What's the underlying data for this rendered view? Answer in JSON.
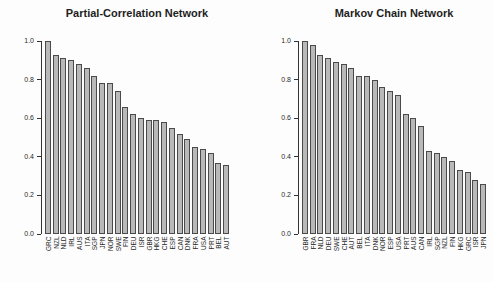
{
  "figure": {
    "background": "#fdfdfd",
    "axis_color": "#333333",
    "bar_fill": "#b9b9b9",
    "bar_border": "#4a4a4a",
    "title_color": "#1f1f1f"
  },
  "chart_data": [
    {
      "type": "bar",
      "title": "Partial-Correlation Network",
      "xlabel": "",
      "ylabel": "",
      "ylim": [
        0.0,
        1.0
      ],
      "yticks": [
        0.0,
        0.2,
        0.4,
        0.6,
        0.8,
        1.0
      ],
      "ytick_labels": [
        "0.0",
        "0.2",
        "0.4",
        "0.6",
        "0.8",
        "1.0"
      ],
      "grid": false,
      "legend": null,
      "categories": [
        "GRC",
        "NZL",
        "NLD",
        "IRL",
        "AUS",
        "ITA",
        "SGP",
        "JPN",
        "NOR",
        "SWE",
        "FIN",
        "DEU",
        "ISR",
        "GBR",
        "HKG",
        "CHE",
        "ESP",
        "CAN",
        "DNK",
        "FRA",
        "USA",
        "PRT",
        "BEL",
        "AUT"
      ],
      "values": [
        1.0,
        0.93,
        0.91,
        0.9,
        0.88,
        0.86,
        0.82,
        0.78,
        0.78,
        0.74,
        0.66,
        0.62,
        0.6,
        0.59,
        0.59,
        0.58,
        0.55,
        0.52,
        0.49,
        0.45,
        0.44,
        0.42,
        0.37,
        0.36
      ]
    },
    {
      "type": "bar",
      "title": "Markov Chain Network",
      "xlabel": "",
      "ylabel": "",
      "ylim": [
        0.0,
        1.0
      ],
      "yticks": [
        0.0,
        0.2,
        0.4,
        0.6,
        0.8,
        1.0
      ],
      "ytick_labels": [
        "0.0",
        "0.2",
        "0.4",
        "0.6",
        "0.8",
        "1.0"
      ],
      "grid": false,
      "legend": null,
      "categories": [
        "GBR",
        "FRA",
        "NLD",
        "DEU",
        "SWE",
        "CHE",
        "AUT",
        "BEL",
        "ITA",
        "DNK",
        "NOR",
        "ESP",
        "USA",
        "PRT",
        "AUS",
        "CAN",
        "IRL",
        "SGP",
        "NZL",
        "FIN",
        "HKG",
        "GRC",
        "ISR",
        "JPN"
      ],
      "values": [
        1.0,
        0.98,
        0.93,
        0.91,
        0.89,
        0.88,
        0.86,
        0.82,
        0.82,
        0.8,
        0.76,
        0.74,
        0.72,
        0.62,
        0.6,
        0.56,
        0.43,
        0.42,
        0.4,
        0.38,
        0.33,
        0.32,
        0.28,
        0.26
      ]
    }
  ]
}
